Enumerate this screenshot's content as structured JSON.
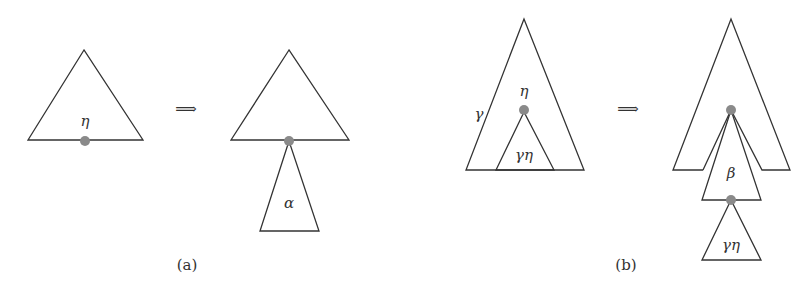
{
  "panels": [
    {
      "caption": "(a)",
      "before": {
        "node_label": "η"
      },
      "arrow": "⟹",
      "after": {
        "subtree_label": "α"
      }
    },
    {
      "caption": "(b)",
      "before": {
        "tree_label": "γ",
        "node_label": "η",
        "subtree_label": "γη"
      },
      "arrow": "⟹",
      "after": {
        "inserted_label": "β",
        "subtree_label": "γη"
      }
    }
  ],
  "colors": {
    "line": "#333333",
    "node_dot": "#8a8a8a"
  }
}
